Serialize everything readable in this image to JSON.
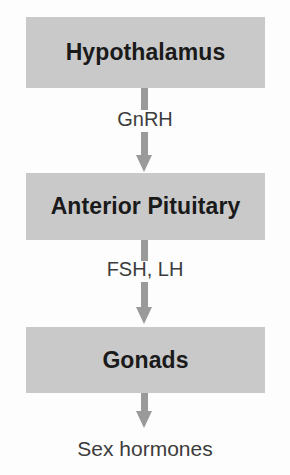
{
  "diagram": {
    "type": "flowchart",
    "orientation": "vertical",
    "colors": {
      "background": "#fdfdfd",
      "box_fill": "#c9c9c9",
      "box_text": "#1a1a1a",
      "arrow": "#9a9a9a",
      "edge_label_text": "#3c3c3c"
    },
    "nodes": [
      {
        "id": "hypothalamus",
        "label": "Hypothalamus",
        "shape": "rectangle",
        "filled": true
      },
      {
        "id": "anterior-pituitary",
        "label": "Anterior Pituitary",
        "shape": "rectangle",
        "filled": true
      },
      {
        "id": "gonads",
        "label": "Gonads",
        "shape": "rectangle",
        "filled": true
      },
      {
        "id": "sex-hormones",
        "label": "Sex hormones",
        "shape": "text",
        "filled": false
      }
    ],
    "edges": [
      {
        "id": "edge-gnrh",
        "from": "hypothalamus",
        "to": "anterior-pituitary",
        "label": "GnRH",
        "arrow": "down"
      },
      {
        "id": "edge-fsh-lh",
        "from": "anterior-pituitary",
        "to": "gonads",
        "label": "FSH, LH",
        "arrow": "down"
      },
      {
        "id": "edge-sex-hormones",
        "from": "gonads",
        "to": "sex-hormones",
        "label": "",
        "arrow": "down"
      }
    ]
  }
}
